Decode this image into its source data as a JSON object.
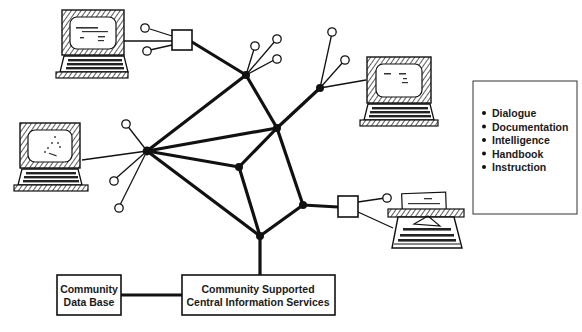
{
  "diagram": {
    "title": "",
    "colors": {
      "ink": "#111111",
      "background": "#ffffff",
      "sketch": "#2a2a2a"
    },
    "services_list": {
      "items": [
        "Dialogue",
        "Documentation",
        "Intelligence",
        "Handbook",
        "Instruction"
      ]
    },
    "boxes": {
      "data_base": {
        "line1": "Community",
        "line2": "Data Base"
      },
      "central": {
        "line1": "Community Supported",
        "line2": "Central Information Services"
      }
    },
    "nodes": [
      {
        "id": "top-hub",
        "x": 246,
        "y": 75
      },
      {
        "id": "right-hub",
        "x": 277,
        "y": 128
      },
      {
        "id": "left-hub",
        "x": 147,
        "y": 151
      },
      {
        "id": "center-hub",
        "x": 239,
        "y": 167
      },
      {
        "id": "top-right-hub",
        "x": 320,
        "y": 88
      },
      {
        "id": "bottom-right-hub",
        "x": 303,
        "y": 205
      },
      {
        "id": "bottom-hub",
        "x": 260,
        "y": 236
      }
    ],
    "terminals": [
      {
        "id": "top-left-terminal",
        "type": "computer-terminal"
      },
      {
        "id": "left-terminal",
        "type": "computer-terminal"
      },
      {
        "id": "top-right-terminal",
        "type": "computer-terminal"
      },
      {
        "id": "teletypewriter",
        "type": "typewriter-terminal"
      }
    ]
  }
}
